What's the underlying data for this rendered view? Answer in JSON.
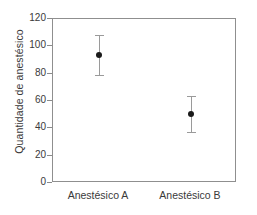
{
  "chart_data": {
    "type": "scatter",
    "title": "",
    "xlabel": "",
    "ylabel": "Quantidade de anestésico",
    "categories": [
      "Anestésico A",
      "Anestésico B"
    ],
    "ylim": [
      0,
      120
    ],
    "yticks": [
      0,
      20,
      40,
      60,
      80,
      100,
      120
    ],
    "ytick_labels": [
      "0",
      "20",
      "40",
      "60",
      "80",
      "100",
      "120"
    ],
    "grid": false,
    "legend": null,
    "error_bars": true,
    "series": [
      {
        "name": "Quantidade de anestésico",
        "values": [
          94,
          50.5
        ],
        "upper": [
          108,
          63.5
        ],
        "lower": [
          79,
          37
        ]
      }
    ],
    "points": [
      {
        "category": "Anestésico A",
        "value": 94,
        "upper": 108,
        "lower": 79
      },
      {
        "category": "Anestésico B",
        "value": 50.5,
        "upper": 63.5,
        "lower": 37
      }
    ],
    "colors": {
      "marker": "#1a1a1a",
      "errorbar": "#9a9a9a",
      "frame": "#8f8f8f",
      "text": "#3a3a3a",
      "background": "#ffffff"
    }
  }
}
